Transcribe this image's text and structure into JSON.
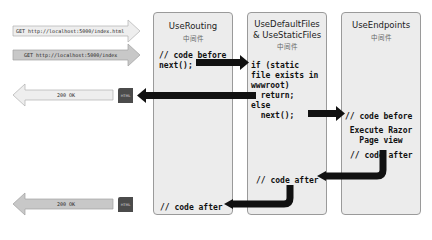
{
  "requests": [
    {
      "label": "GET http://localhost:5000/index.html"
    },
    {
      "label": "GET http://localhost:5000/index"
    }
  ],
  "responses": [
    {
      "label": "200 OK",
      "icon": "HTML"
    },
    {
      "label": "200 OK",
      "icon": "HTML"
    }
  ],
  "middleware": [
    {
      "title": "UseRouting",
      "subtitle": "中间件",
      "code_before": "// code before\nnext();",
      "code_after": "// code after"
    },
    {
      "title_line1": "UseDefaultFiles",
      "title_line2": "& UseStaticFiles",
      "subtitle": "中间件",
      "code": "if (static\nfile exists in\nwwwroot)\n  return;\nelse\n  next();",
      "code_after": "// code after"
    },
    {
      "title": "UseEndpoints",
      "subtitle": "中间件",
      "code_before": "// code before",
      "execute": "Execute Razor\nPage view",
      "code_after": "// code after"
    }
  ],
  "colors": {
    "box_bg": "#ececec",
    "box_border": "#9a9a9a",
    "flow_arrow": "#111111",
    "request_arrow_light": "#eeeeee",
    "request_arrow_dark": "#c8c8c8",
    "html_icon": "#4b4b4b"
  }
}
